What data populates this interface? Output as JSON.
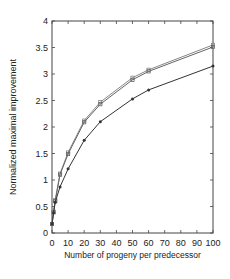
{
  "chart_data": {
    "type": "line",
    "title": "",
    "xlabel": "Number of progeny per predecessor",
    "ylabel": "Normalized maximal improvement",
    "xlim": [
      0,
      100
    ],
    "ylim": [
      0,
      4
    ],
    "xticks": [
      0,
      10,
      20,
      30,
      40,
      50,
      60,
      70,
      80,
      90,
      100
    ],
    "yticks": [
      0,
      0.5,
      1,
      1.5,
      2,
      2.5,
      3,
      3.5,
      4
    ],
    "ytick_labels": [
      "0",
      "0.5",
      "1",
      "1.5",
      "2",
      "2.5",
      "3",
      "3.5",
      "4"
    ],
    "grid": false,
    "legend": null,
    "series": [
      {
        "name": "upper series A",
        "marker": "square",
        "color": "#888888",
        "x": [
          0,
          1,
          2,
          5,
          10,
          20,
          30,
          50,
          60,
          100
        ],
        "y": [
          0.17,
          0.4,
          0.62,
          1.12,
          1.52,
          2.12,
          2.47,
          2.93,
          3.08,
          3.55
        ]
      },
      {
        "name": "upper series B",
        "marker": "square",
        "color": "#666666",
        "x": [
          0,
          1,
          2,
          5,
          10,
          20,
          30,
          50,
          60,
          100
        ],
        "y": [
          0.17,
          0.39,
          0.6,
          1.1,
          1.49,
          2.09,
          2.43,
          2.89,
          3.05,
          3.51
        ]
      },
      {
        "name": "lower series",
        "marker": "dot",
        "color": "#333333",
        "x": [
          0,
          1,
          2,
          5,
          10,
          20,
          30,
          50,
          60,
          100
        ],
        "y": [
          0.17,
          0.38,
          0.58,
          0.87,
          1.21,
          1.75,
          2.1,
          2.53,
          2.7,
          3.15
        ]
      }
    ]
  }
}
